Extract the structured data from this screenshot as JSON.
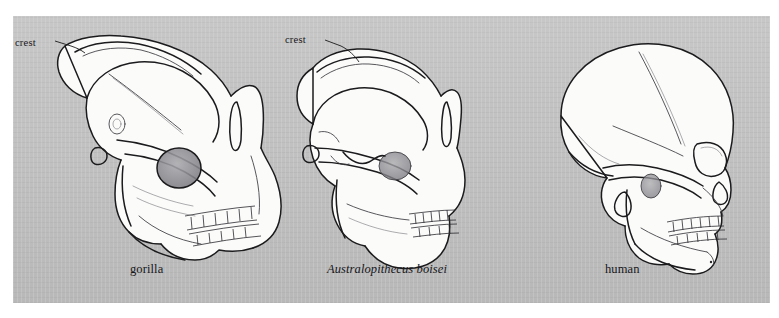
{
  "figure": {
    "type": "comparative-anatomy-illustration",
    "background_color": "#c2c2c2",
    "page_color": "#ffffff",
    "ink_color": "#1b1b1d",
    "bone_color": "#fbfbfa"
  },
  "specimens": [
    {
      "id": "gorilla",
      "label": "gorilla",
      "italic": false,
      "annotation": "crest",
      "has_crest_callout": true
    },
    {
      "id": "australopithecus-boisei",
      "label": "Australopithecus boisei",
      "italic": true,
      "annotation": "crest",
      "has_crest_callout": true
    },
    {
      "id": "human",
      "label": "human",
      "italic": false,
      "annotation": "",
      "has_crest_callout": false
    }
  ],
  "annotations": {
    "crest_gorilla": "crest",
    "crest_australopithecus": "crest"
  }
}
